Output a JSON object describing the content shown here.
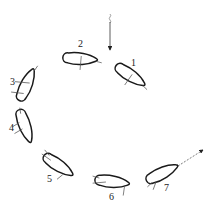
{
  "diagram": {
    "title": "",
    "incoming_arrow": {
      "direction": "down",
      "style": "solid with wavy tail"
    },
    "outgoing_arrow": {
      "direction": "up-right",
      "style": "dashed"
    },
    "blades": [
      {
        "id": "1",
        "label": "1",
        "cx": 137,
        "cy": 78,
        "angle": 35
      },
      {
        "id": "2",
        "label": "2",
        "cx": 81,
        "cy": 59,
        "angle": 5
      },
      {
        "id": "3",
        "label": "3",
        "cx": 25,
        "cy": 84,
        "angle": -65
      },
      {
        "id": "4",
        "label": "4",
        "cx": 26,
        "cy": 128,
        "angle": 72
      },
      {
        "id": "5",
        "label": "5",
        "cx": 59,
        "cy": 167,
        "angle": 35
      },
      {
        "id": "6",
        "label": "6",
        "cx": 113,
        "cy": 182,
        "angle": 8
      },
      {
        "id": "7",
        "label": "7",
        "cx": 163,
        "cy": 173,
        "angle": -25
      }
    ],
    "labels": {
      "l1": "1",
      "l2": "2",
      "l3": "3",
      "l4": "4",
      "l5": "5",
      "l6": "6",
      "l7": "7"
    }
  }
}
